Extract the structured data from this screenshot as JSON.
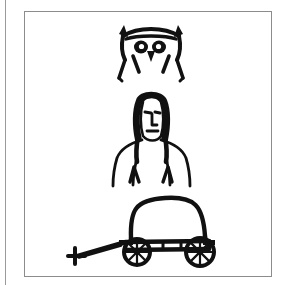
{
  "page": {
    "width": 286,
    "height": 285,
    "background_color": "#ffffff",
    "ink_color": "#111111",
    "frame_border_color": "#8c8c8c",
    "margin_rule_color": "#9a9a9a"
  },
  "caption_sliver": {
    "text": "··          ···",
    "note_color": "#c9c9c9"
  },
  "figure": {
    "drawings": [
      {
        "id": "owl-face",
        "label": "Owl face with tufted ears",
        "order": 1,
        "features": [
          "pointed ear tufts",
          "two round eyes",
          "beak",
          "cheek whisker strokes"
        ]
      },
      {
        "id": "person",
        "label": "Person with long hair, head, torso and arms",
        "order": 2,
        "features": [
          "long dark hair",
          "eyes",
          "nose",
          "mouth",
          "shoulders",
          "two arms",
          "hands"
        ]
      },
      {
        "id": "covered-wagon",
        "label": "Covered wagon with two spoked wheels and draft tongue",
        "order": 3,
        "features": [
          "arched canopy",
          "wagon bed",
          "front wheel",
          "rear wheel",
          "eight spokes per wheel",
          "tongue with whippletree crossbar"
        ]
      }
    ]
  }
}
